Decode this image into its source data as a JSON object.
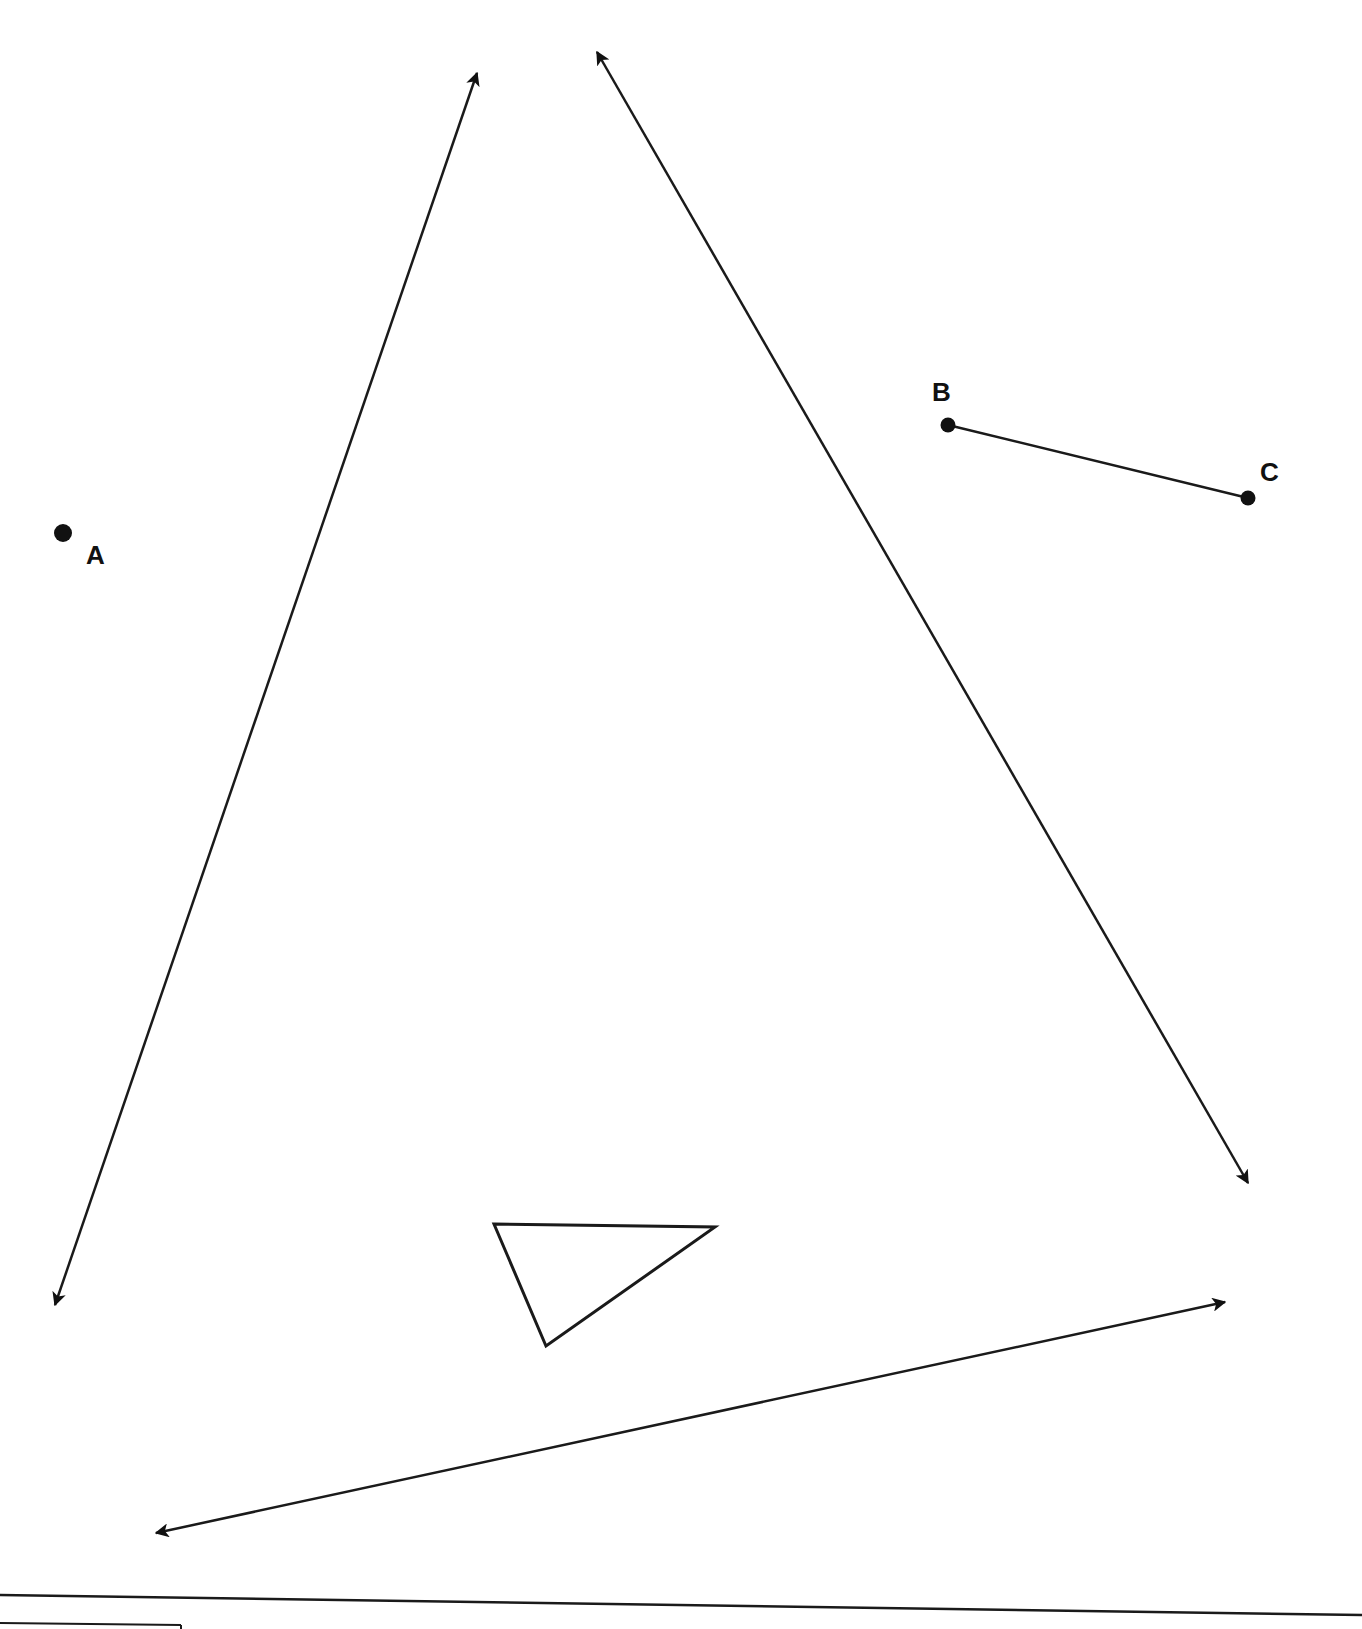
{
  "diagram": {
    "type": "geometry-figure",
    "points": [
      {
        "id": "A",
        "label": "A",
        "x": 63,
        "y": 533,
        "label_x": 86,
        "label_y": 564
      },
      {
        "id": "B",
        "label": "B",
        "x": 948,
        "y": 425,
        "label_x": 932,
        "label_y": 401
      },
      {
        "id": "C",
        "label": "C",
        "x": 1248,
        "y": 498,
        "label_x": 1260,
        "label_y": 481
      }
    ],
    "segments": [
      {
        "name": "segment-BC",
        "from": "B",
        "to": "C"
      }
    ],
    "lines": [
      {
        "name": "line-left",
        "x1": 477,
        "y1": 73,
        "x2": 55,
        "y2": 1305
      },
      {
        "name": "line-right",
        "x1": 597,
        "y1": 52,
        "x2": 1248,
        "y2": 1183
      },
      {
        "name": "line-bottom",
        "x1": 1225,
        "y1": 1302,
        "x2": 156,
        "y2": 1533
      }
    ],
    "triangle": {
      "points": "494,1224 715,1227 546,1346"
    },
    "divider": {
      "x1": 0,
      "y1": 1595,
      "x2": 1362,
      "y2": 1615
    },
    "box_partial": {
      "x1": 0,
      "y1": 1623,
      "x2": 181,
      "y2": 1625
    }
  }
}
